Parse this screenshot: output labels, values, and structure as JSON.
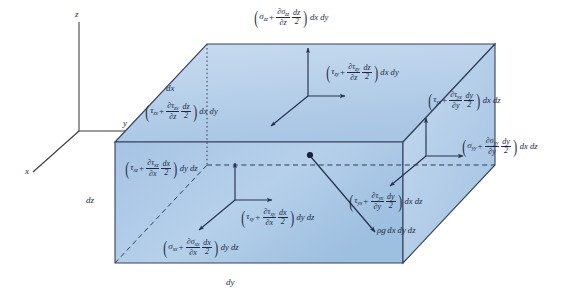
{
  "figure": {
    "background_color": "#ffffff",
    "face_fill_top": "#b3cde8",
    "face_fill_front": "#a9c6e4",
    "face_fill_right": "#bcd4ec",
    "edge_color": "#33415c",
    "text_color": "#1b2a45"
  },
  "axes": {
    "z_label": "z",
    "y_label": "y",
    "x_label": "x"
  },
  "dimensions": [
    {
      "name": "dx-edge",
      "label": "dx"
    },
    {
      "name": "dz-edge",
      "label": "dz"
    },
    {
      "name": "dy-edge",
      "label": "dy"
    }
  ],
  "stress_terms": [
    {
      "id": "sigma-zz-top",
      "face": "top",
      "stress": "σ",
      "stress_sub": "zz",
      "deriv_sub": "zz",
      "deriv_var": "z",
      "differential": "dz",
      "half": "2",
      "area": "dx dy",
      "plain": "(σzz + ∂σzz/∂z · dz/2) dx dy"
    },
    {
      "id": "tau-zy-top",
      "face": "top",
      "stress": "τ",
      "stress_sub": "zy",
      "deriv_sub": "zy",
      "deriv_var": "z",
      "differential": "dz",
      "half": "2",
      "area": "dx dy",
      "plain": "(τzy + ∂τzy/∂z · dz/2) dx dy"
    },
    {
      "id": "tau-zx-top",
      "face": "top",
      "stress": "τ",
      "stress_sub": "zx",
      "deriv_sub": "zx",
      "deriv_var": "z",
      "differential": "dz",
      "half": "2",
      "area": "dx dy",
      "plain": "(τzx + ∂τzx/∂z · dz/2) dx dy"
    },
    {
      "id": "tau-xz-front",
      "face": "front",
      "stress": "τ",
      "stress_sub": "xz",
      "deriv_sub": "xz",
      "deriv_var": "x",
      "differential": "dx",
      "half": "2",
      "area": "dy dz",
      "plain": "(τxz + ∂τxz/∂x · dx/2) dy dz"
    },
    {
      "id": "tau-xy-front",
      "face": "front",
      "stress": "τ",
      "stress_sub": "xy",
      "deriv_sub": "xy",
      "deriv_var": "x",
      "differential": "dx",
      "half": "2",
      "area": "dy dz",
      "plain": "(τxy + ∂τxy/∂x · dx/2) dy dz"
    },
    {
      "id": "sigma-xx-front",
      "face": "front",
      "stress": "σ",
      "stress_sub": "xx",
      "deriv_sub": "xx",
      "deriv_var": "x",
      "differential": "dx",
      "half": "2",
      "area": "dy dz",
      "plain": "(σxx + ∂σxx/∂x · dx/2) dy dz"
    },
    {
      "id": "tau-yz-right",
      "face": "right",
      "stress": "τ",
      "stress_sub": "yz",
      "deriv_sub": "yz",
      "deriv_var": "y",
      "differential": "dy",
      "half": "2",
      "area": "dx dz",
      "plain": "(τyz + ∂τyz/∂y · dy/2) dx dz"
    },
    {
      "id": "sigma-yy-right",
      "face": "right",
      "stress": "σ",
      "stress_sub": "yy",
      "deriv_sub": "yy",
      "deriv_var": "y",
      "differential": "dy",
      "half": "2",
      "area": "dx dz",
      "plain": "(σyy + ∂σyy/∂y · dy/2) dx dz"
    },
    {
      "id": "tau-yx-right",
      "face": "right",
      "stress": "τ",
      "stress_sub": "yx",
      "deriv_sub": "yx",
      "deriv_var": "y",
      "differential": "dy",
      "half": "2",
      "area": "dx dz",
      "plain": "(τyx + ∂τyx/∂y · dy/2) dx dz"
    }
  ],
  "body_force": {
    "id": "rho-g",
    "rho": "ρ",
    "g": "g",
    "volume": "dx dy dz",
    "plain": "ρg dx dy dz"
  }
}
